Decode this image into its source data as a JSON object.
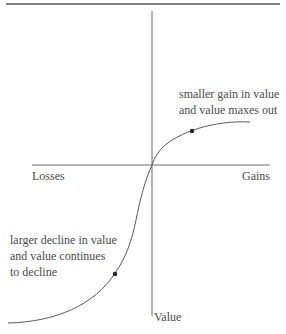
{
  "diagram": {
    "type": "value-function",
    "axes": {
      "x_negative_label": "Losses",
      "x_positive_label": "Gains",
      "y_label": "Value"
    },
    "annotations": {
      "gain_note_line1": "smaller gain in value",
      "gain_note_line2": "and value maxes out",
      "loss_note_line1": "larger decline in value",
      "loss_note_line2": "and value continues",
      "loss_note_line3": "to decline"
    },
    "colors": {
      "line": "#6b6b6b",
      "curve": "#5a5a5a",
      "dot": "#2a2a2a",
      "text": "#4a4a4a"
    }
  }
}
